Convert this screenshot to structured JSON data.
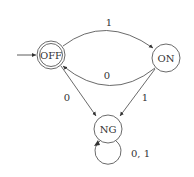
{
  "diagram": {
    "type": "state-machine",
    "states": [
      {
        "id": "OFF",
        "label": "OFF",
        "initial": true,
        "accepting": true
      },
      {
        "id": "ON",
        "label": "ON",
        "initial": false,
        "accepting": false
      },
      {
        "id": "NG",
        "label": "NG",
        "initial": false,
        "accepting": false
      }
    ],
    "transitions": [
      {
        "from": "OFF",
        "to": "ON",
        "label": "1"
      },
      {
        "from": "ON",
        "to": "OFF",
        "label": "0"
      },
      {
        "from": "OFF",
        "to": "NG",
        "label": "0"
      },
      {
        "from": "ON",
        "to": "NG",
        "label": "1"
      },
      {
        "from": "NG",
        "to": "NG",
        "label": "0,1"
      }
    ],
    "labels": {
      "off_to_on": "1",
      "on_to_off": "0",
      "off_to_ng": "0",
      "on_to_ng": "1",
      "ng_loop": "0, 1"
    }
  }
}
